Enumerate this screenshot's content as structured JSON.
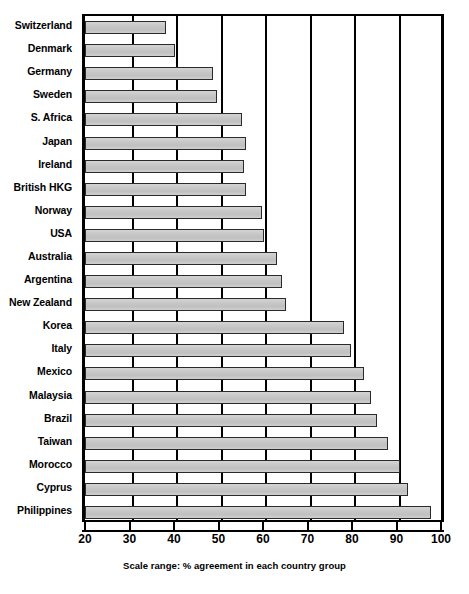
{
  "chart_data": {
    "type": "bar",
    "orientation": "horizontal",
    "title": "",
    "subtitle": "",
    "xlabel": "Scale range: % agreement in each country group",
    "ylabel": "",
    "xlim": [
      20,
      100
    ],
    "xticks": [
      20,
      30,
      40,
      50,
      60,
      70,
      80,
      90,
      100
    ],
    "xtick_labels": [
      "20",
      "30",
      "40",
      "50",
      "60",
      "70",
      "80",
      "90",
      "100"
    ],
    "grid": true,
    "grid_axis": "x",
    "legend": false,
    "legend_position": "none",
    "bar_fill_color": "#c9c9c9",
    "bar_edge_color": "#2a2a2a",
    "categories": [
      "Switzerland",
      "Denmark",
      "Germany",
      "Sweden",
      "S. Africa",
      "Japan",
      "Ireland",
      "British HKG",
      "Norway",
      "USA",
      "Australia",
      "Argentina",
      "New Zealand",
      "Korea",
      "Italy",
      "Mexico",
      "Malaysia",
      "Brazil",
      "Taiwan",
      "Morocco",
      "Cyprus",
      "Philippines"
    ],
    "values": [
      37.5,
      39.5,
      48,
      49,
      54.5,
      55.5,
      55,
      55.5,
      59,
      59.5,
      62.5,
      63.5,
      64.5,
      77.5,
      79,
      82,
      83.5,
      85,
      87.5,
      90,
      92,
      97
    ]
  }
}
